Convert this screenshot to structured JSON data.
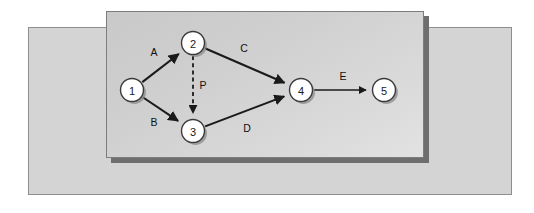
{
  "figure": {
    "background_color": "#ffffff",
    "outer_panel_color": "#d4d4d4",
    "inner_panel_color": "#d5d5d5",
    "shadow_color": "#6e6e6e",
    "watermark_text": ""
  },
  "diagram": {
    "type": "directed-graph",
    "node_fill": "#ffffff",
    "node_stroke": "#3a3a3a",
    "edge_color": "#1a1a1a",
    "nodes": [
      {
        "id": "1",
        "label": "1",
        "cx": 25,
        "cy": 78
      },
      {
        "id": "2",
        "label": "2",
        "cx": 86,
        "cy": 31
      },
      {
        "id": "3",
        "label": "3",
        "cx": 86,
        "cy": 119
      },
      {
        "id": "4",
        "label": "4",
        "cx": 194,
        "cy": 78
      },
      {
        "id": "5",
        "label": "5",
        "cx": 277,
        "cy": 78
      }
    ],
    "edges": [
      {
        "id": "A",
        "label": "A",
        "from": "1",
        "to": "2",
        "style": "solid",
        "label_x": 47,
        "label_y": 40
      },
      {
        "id": "B",
        "label": "B",
        "from": "1",
        "to": "3",
        "style": "solid",
        "label_x": 47,
        "label_y": 110
      },
      {
        "id": "C",
        "label": "C",
        "from": "2",
        "to": "4",
        "style": "solid",
        "label_x": 137,
        "label_y": 36
      },
      {
        "id": "D",
        "label": "D",
        "from": "3",
        "to": "4",
        "style": "solid",
        "label_x": 140,
        "label_y": 116
      },
      {
        "id": "E",
        "label": "E",
        "from": "4",
        "to": "5",
        "style": "solid",
        "label_x": 236,
        "label_y": 64
      },
      {
        "id": "P",
        "label": "P",
        "from": "2",
        "to": "3",
        "style": "dashed",
        "label_x": 96,
        "label_y": 73
      }
    ]
  }
}
